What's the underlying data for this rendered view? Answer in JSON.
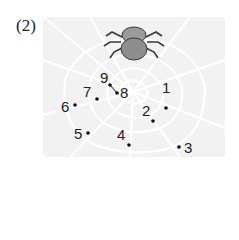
{
  "problem_label": "(2)",
  "colors": {
    "panel": "#f2f2f2",
    "web": "#ffffff",
    "spider_body": "#8e8e8e",
    "spider_legs": "#3a3a3a",
    "dot": "#111111"
  },
  "dots": [
    {
      "label": "1",
      "x": 166,
      "y": 108
    },
    {
      "label": "2",
      "x": 153,
      "y": 121
    },
    {
      "label": "3",
      "x": 179,
      "y": 147
    },
    {
      "label": "4",
      "x": 129,
      "y": 145
    },
    {
      "label": "5",
      "x": 88,
      "y": 133
    },
    {
      "label": "6",
      "x": 75,
      "y": 105
    },
    {
      "label": "7",
      "x": 97,
      "y": 99
    },
    {
      "label": "8",
      "x": 117,
      "y": 93
    },
    {
      "label": "9",
      "x": 110,
      "y": 85
    }
  ],
  "number_labels": [
    {
      "text": "1",
      "x": 162,
      "y": 88
    },
    {
      "text": "2",
      "x": 142,
      "y": 107
    },
    {
      "text": "3",
      "x": 184,
      "y": 140
    },
    {
      "text": "4",
      "x": 117,
      "y": 130
    },
    {
      "text": "5",
      "x": 74,
      "y": 125
    },
    {
      "text": "6",
      "x": 60,
      "y": 99
    },
    {
      "text": "7",
      "x": 83,
      "y": 83
    },
    {
      "text": "8",
      "x": 121,
      "y": 84
    },
    {
      "text": "9",
      "x": 100,
      "y": 68
    }
  ]
}
